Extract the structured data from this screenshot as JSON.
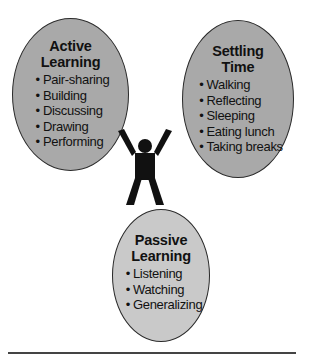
{
  "diagram": {
    "active_learning": {
      "title_line1": "Active",
      "title_line2": "Learning",
      "items": [
        "Pair-sharing",
        "Building",
        "Discussing",
        "Drawing",
        "Performing"
      ]
    },
    "settling_time": {
      "title_line1": "Settling",
      "title_line2": "Time",
      "items": [
        "Walking",
        "Reflecting",
        "Sleeping",
        "Eating lunch",
        "Taking breaks"
      ]
    },
    "passive_learning": {
      "title_line1": "Passive",
      "title_line2": "Learning",
      "items": [
        "Listening",
        "Watching",
        "Generalizing"
      ]
    },
    "center_icon": "person-arms-raised-icon",
    "colors": {
      "dark_ellipse": "#a9a9a9",
      "light_ellipse": "#c9c9c9",
      "outline": "#2a2a2a",
      "figure": "#111111"
    }
  }
}
